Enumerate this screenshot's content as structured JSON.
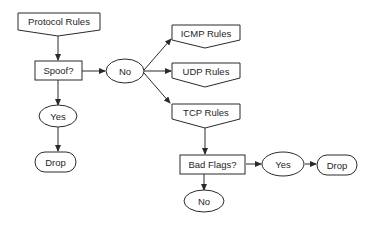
{
  "diagram": {
    "type": "flowchart",
    "nodes": {
      "protocol_rules": {
        "label": "Protocol Rules",
        "shape": "offpage-connector"
      },
      "spoof": {
        "label": "Spoof?",
        "shape": "rectangle"
      },
      "spoof_no": {
        "label": "No",
        "shape": "ellipse"
      },
      "spoof_yes": {
        "label": "Yes",
        "shape": "ellipse"
      },
      "drop_1": {
        "label": "Drop",
        "shape": "terminator"
      },
      "icmp_rules": {
        "label": "ICMP Rules",
        "shape": "offpage-connector"
      },
      "udp_rules": {
        "label": "UDP Rules",
        "shape": "offpage-connector"
      },
      "tcp_rules": {
        "label": "TCP Rules",
        "shape": "offpage-connector"
      },
      "bad_flags": {
        "label": "Bad Flags?",
        "shape": "rectangle"
      },
      "flags_yes": {
        "label": "Yes",
        "shape": "ellipse"
      },
      "drop_2": {
        "label": "Drop",
        "shape": "terminator"
      },
      "flags_no": {
        "label": "No",
        "shape": "ellipse"
      }
    },
    "edges": [
      {
        "from": "protocol_rules",
        "to": "spoof"
      },
      {
        "from": "spoof",
        "to": "spoof_no"
      },
      {
        "from": "spoof",
        "to": "spoof_yes"
      },
      {
        "from": "spoof_yes",
        "to": "drop_1"
      },
      {
        "from": "spoof_no",
        "to": "icmp_rules"
      },
      {
        "from": "spoof_no",
        "to": "udp_rules"
      },
      {
        "from": "spoof_no",
        "to": "tcp_rules"
      },
      {
        "from": "tcp_rules",
        "to": "bad_flags"
      },
      {
        "from": "bad_flags",
        "to": "flags_yes"
      },
      {
        "from": "flags_yes",
        "to": "drop_2"
      },
      {
        "from": "bad_flags",
        "to": "flags_no"
      }
    ]
  }
}
